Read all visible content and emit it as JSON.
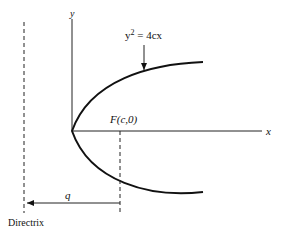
{
  "diagram": {
    "axis_labels": {
      "x": "x",
      "y": "y"
    },
    "equation": {
      "base": "y",
      "exponent": "2",
      "rest": " = 4cx"
    },
    "focus_label": "F(c,0)",
    "distance_label": "q",
    "directrix_label": "Directrix",
    "colors": {
      "line": "#111111",
      "background": "#ffffff"
    }
  }
}
